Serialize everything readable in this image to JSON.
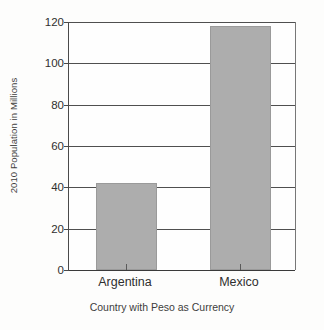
{
  "chart_data": {
    "type": "bar",
    "title": "",
    "subtitle": "",
    "categories": [
      "Argentina",
      "Mexico"
    ],
    "values": [
      42,
      118
    ],
    "xlabel": "Country with Peso as Currency",
    "ylabel": "2010 Population in Millions",
    "ylim": [
      0,
      120
    ],
    "yticks": [
      0,
      20,
      40,
      60,
      80,
      100,
      120
    ],
    "ytick_labels": [
      "0",
      "20",
      "40",
      "60",
      "80",
      "100",
      "120"
    ],
    "grid": true,
    "grid_axis": "y",
    "legend": false,
    "legend_position": "none",
    "bar_color": "#adadad",
    "bar_edge_color": "#9a9a9a",
    "axis_color": "#4a4a4a",
    "background_color": "#fdfdfc",
    "series": [
      {
        "name": "2010 Population in Millions",
        "values": [
          42,
          118
        ]
      }
    ]
  }
}
